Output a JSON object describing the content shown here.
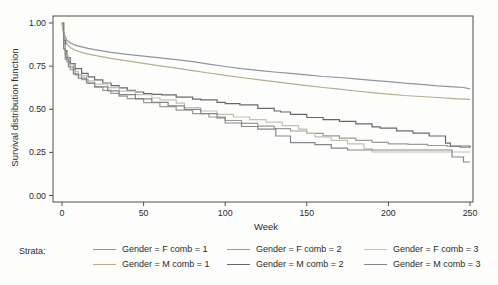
{
  "figure": {
    "background": "#fdfdfb",
    "frame_color": "#4f4f4f",
    "text_color": "#2b2b2b"
  },
  "axes": {
    "x_label": "Week",
    "y_label": "Survival distribution function",
    "x_ticks": [
      "0",
      "50",
      "100",
      "150",
      "200",
      "250"
    ],
    "x_tick_values": [
      0,
      50,
      100,
      150,
      200,
      250
    ],
    "y_ticks": [
      "1.00",
      "0.75",
      "0.50",
      "0.25",
      "0.00"
    ],
    "y_tick_values": [
      1.0,
      0.75,
      0.5,
      0.25,
      0.0
    ],
    "x_range": [
      0,
      250
    ],
    "y_range": [
      0.0,
      1.0
    ]
  },
  "legend": {
    "title": "Strata:",
    "items": [
      {
        "label": "Gender = F comb = 1",
        "color": "#8e94a2"
      },
      {
        "label": "Gender = M comb = 1",
        "color": "#b7ac8f"
      },
      {
        "label": "Gender = F comb = 2",
        "color": "#9b9b97"
      },
      {
        "label": "Gender = M comb = 2",
        "color": "#67696e"
      },
      {
        "label": "Gender = F comb = 3",
        "color": "#c4c0b2"
      },
      {
        "label": "Gender = M comb = 3",
        "color": "#83878c"
      }
    ]
  },
  "chart_data": {
    "type": "line",
    "subtype": "kaplan-meier-survival",
    "title": "",
    "xlabel": "Week",
    "ylabel": "Survival distribution function",
    "xlim": [
      0,
      250
    ],
    "ylim": [
      0.0,
      1.0
    ],
    "grid": false,
    "legend_position": "bottom",
    "series": [
      {
        "name": "Gender = F comb = 1",
        "color": "#8e94a2",
        "interpolation": "linear",
        "points": [
          [
            0,
            1.0
          ],
          [
            1,
            0.945
          ],
          [
            2,
            0.92
          ],
          [
            3,
            0.9
          ],
          [
            5,
            0.885
          ],
          [
            8,
            0.872
          ],
          [
            12,
            0.862
          ],
          [
            16,
            0.853
          ],
          [
            20,
            0.845
          ],
          [
            30,
            0.83
          ],
          [
            40,
            0.818
          ],
          [
            50,
            0.808
          ],
          [
            60,
            0.798
          ],
          [
            70,
            0.788
          ],
          [
            80,
            0.776
          ],
          [
            90,
            0.762
          ],
          [
            100,
            0.748
          ],
          [
            110,
            0.735
          ],
          [
            120,
            0.726
          ],
          [
            130,
            0.716
          ],
          [
            140,
            0.708
          ],
          [
            150,
            0.699
          ],
          [
            160,
            0.69
          ],
          [
            170,
            0.684
          ],
          [
            180,
            0.676
          ],
          [
            190,
            0.668
          ],
          [
            200,
            0.66
          ],
          [
            210,
            0.651
          ],
          [
            220,
            0.644
          ],
          [
            230,
            0.636
          ],
          [
            240,
            0.63
          ],
          [
            246,
            0.626
          ],
          [
            250,
            0.618
          ]
        ]
      },
      {
        "name": "Gender = M comb = 1",
        "color": "#b7ac8f",
        "interpolation": "linear",
        "points": [
          [
            0,
            1.0
          ],
          [
            1,
            0.93
          ],
          [
            2,
            0.9
          ],
          [
            3,
            0.878
          ],
          [
            5,
            0.858
          ],
          [
            8,
            0.842
          ],
          [
            12,
            0.83
          ],
          [
            16,
            0.82
          ],
          [
            20,
            0.812
          ],
          [
            30,
            0.795
          ],
          [
            40,
            0.78
          ],
          [
            50,
            0.766
          ],
          [
            60,
            0.752
          ],
          [
            70,
            0.738
          ],
          [
            80,
            0.724
          ],
          [
            90,
            0.71
          ],
          [
            100,
            0.697
          ],
          [
            110,
            0.684
          ],
          [
            120,
            0.672
          ],
          [
            130,
            0.66
          ],
          [
            140,
            0.648
          ],
          [
            150,
            0.637
          ],
          [
            160,
            0.626
          ],
          [
            170,
            0.616
          ],
          [
            180,
            0.606
          ],
          [
            190,
            0.596
          ],
          [
            200,
            0.588
          ],
          [
            210,
            0.58
          ],
          [
            220,
            0.574
          ],
          [
            230,
            0.568
          ],
          [
            240,
            0.562
          ],
          [
            250,
            0.557
          ]
        ]
      },
      {
        "name": "Gender = F comb = 2",
        "color": "#9b9b97",
        "interpolation": "step",
        "points": [
          [
            0,
            1.0
          ],
          [
            1,
            0.88
          ],
          [
            2,
            0.815
          ],
          [
            3,
            0.775
          ],
          [
            5,
            0.73
          ],
          [
            8,
            0.7
          ],
          [
            12,
            0.672
          ],
          [
            16,
            0.65
          ],
          [
            20,
            0.63
          ],
          [
            25,
            0.61
          ],
          [
            30,
            0.592
          ],
          [
            35,
            0.576
          ],
          [
            40,
            0.562
          ],
          [
            50,
            0.538
          ],
          [
            60,
            0.515
          ],
          [
            70,
            0.495
          ],
          [
            80,
            0.475
          ],
          [
            90,
            0.455
          ],
          [
            100,
            0.435
          ],
          [
            110,
            0.418
          ],
          [
            120,
            0.402
          ],
          [
            130,
            0.388
          ],
          [
            140,
            0.374
          ],
          [
            150,
            0.36
          ],
          [
            160,
            0.346
          ],
          [
            170,
            0.333
          ],
          [
            180,
            0.32
          ],
          [
            190,
            0.308
          ],
          [
            200,
            0.3
          ],
          [
            212,
            0.296
          ],
          [
            224,
            0.29
          ],
          [
            236,
            0.284
          ],
          [
            244,
            0.278
          ],
          [
            250,
            0.275
          ]
        ]
      },
      {
        "name": "Gender = M comb = 2",
        "color": "#67696e",
        "interpolation": "step",
        "points": [
          [
            0,
            1.0
          ],
          [
            1,
            0.9
          ],
          [
            2,
            0.84
          ],
          [
            3,
            0.8
          ],
          [
            5,
            0.765
          ],
          [
            8,
            0.735
          ],
          [
            12,
            0.708
          ],
          [
            16,
            0.688
          ],
          [
            20,
            0.67
          ],
          [
            25,
            0.652
          ],
          [
            30,
            0.637
          ],
          [
            35,
            0.624
          ],
          [
            40,
            0.61
          ],
          [
            45,
            0.6
          ],
          [
            50,
            0.59
          ],
          [
            55,
            0.586
          ],
          [
            61,
            0.583
          ],
          [
            70,
            0.57
          ],
          [
            80,
            0.558
          ],
          [
            85,
            0.554
          ],
          [
            95,
            0.54
          ],
          [
            100,
            0.532
          ],
          [
            109,
            0.525
          ],
          [
            120,
            0.505
          ],
          [
            130,
            0.49
          ],
          [
            134,
            0.484
          ],
          [
            140,
            0.47
          ],
          [
            150,
            0.452
          ],
          [
            160,
            0.44
          ],
          [
            170,
            0.43
          ],
          [
            180,
            0.415
          ],
          [
            190,
            0.398
          ],
          [
            195,
            0.391
          ],
          [
            205,
            0.375
          ],
          [
            215,
            0.362
          ],
          [
            225,
            0.345
          ],
          [
            235,
            0.304
          ],
          [
            238,
            0.287
          ],
          [
            250,
            0.281
          ]
        ]
      },
      {
        "name": "Gender = F comb = 3",
        "color": "#c4c0b2",
        "interpolation": "step",
        "points": [
          [
            0,
            1.0
          ],
          [
            1,
            0.87
          ],
          [
            2,
            0.81
          ],
          [
            4,
            0.76
          ],
          [
            7,
            0.72
          ],
          [
            10,
            0.695
          ],
          [
            15,
            0.665
          ],
          [
            20,
            0.645
          ],
          [
            28,
            0.625
          ],
          [
            35,
            0.605
          ],
          [
            45,
            0.585
          ],
          [
            55,
            0.565
          ],
          [
            60,
            0.555
          ],
          [
            70,
            0.535
          ],
          [
            75,
            0.51
          ],
          [
            85,
            0.49
          ],
          [
            95,
            0.47
          ],
          [
            105,
            0.455
          ],
          [
            115,
            0.44
          ],
          [
            125,
            0.425
          ],
          [
            135,
            0.405
          ],
          [
            145,
            0.385
          ],
          [
            150,
            0.36
          ],
          [
            155,
            0.34
          ],
          [
            165,
            0.32
          ],
          [
            175,
            0.3
          ],
          [
            185,
            0.27
          ],
          [
            190,
            0.252
          ],
          [
            250,
            0.252
          ]
        ]
      },
      {
        "name": "Gender = M comb = 3",
        "color": "#83878c",
        "interpolation": "step",
        "points": [
          [
            0,
            1.0
          ],
          [
            1,
            0.85
          ],
          [
            2,
            0.79
          ],
          [
            4,
            0.745
          ],
          [
            7,
            0.705
          ],
          [
            10,
            0.68
          ],
          [
            15,
            0.652
          ],
          [
            20,
            0.63
          ],
          [
            28,
            0.607
          ],
          [
            35,
            0.585
          ],
          [
            45,
            0.56
          ],
          [
            55,
            0.54
          ],
          [
            65,
            0.52
          ],
          [
            75,
            0.5
          ],
          [
            85,
            0.475
          ],
          [
            95,
            0.45
          ],
          [
            100,
            0.42
          ],
          [
            110,
            0.4
          ],
          [
            120,
            0.385
          ],
          [
            131,
            0.345
          ],
          [
            140,
            0.306
          ],
          [
            155,
            0.295
          ],
          [
            165,
            0.275
          ],
          [
            175,
            0.264
          ],
          [
            200,
            0.264
          ],
          [
            239,
            0.223
          ],
          [
            246,
            0.194
          ],
          [
            250,
            0.194
          ]
        ]
      }
    ]
  }
}
